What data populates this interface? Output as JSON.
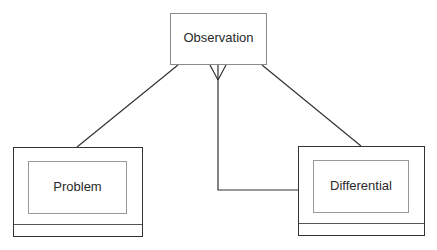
{
  "diagram": {
    "entities": [
      {
        "id": "observation",
        "label": "Observation"
      },
      {
        "id": "problem",
        "label": "Problem"
      },
      {
        "id": "differential",
        "label": "Differential"
      }
    ],
    "relationships": [
      {
        "from": "observation",
        "to": "problem",
        "type": "line"
      },
      {
        "from": "observation",
        "to": "differential",
        "type": "line"
      },
      {
        "from": "observation",
        "to": "differential",
        "type": "crows-foot-many",
        "note": "many end at Observation"
      }
    ],
    "colors": {
      "line": "#333333",
      "box_border": "#8a8a8a",
      "text": "#2a2a2a"
    }
  }
}
